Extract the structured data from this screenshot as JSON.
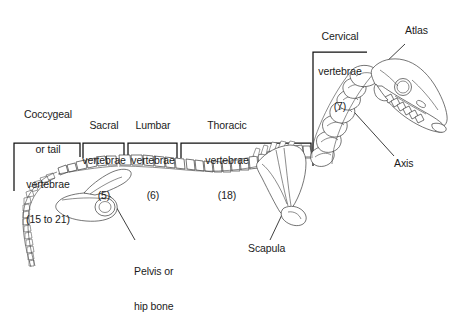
{
  "figure": {
    "background_color": "#ffffff",
    "line_color": "#3a3a3a",
    "text_color": "#1b1b1b"
  },
  "region_labels": [
    {
      "id": "coccygeal",
      "lines": [
        "Coccygeal",
        "or tail",
        "vertebrae",
        "(15 to 21)"
      ],
      "count_text": "(15 to 21)",
      "name": "Coccygeal or tail vertebrae",
      "bracket": {
        "left": 14,
        "right": 80,
        "top": 143
      }
    },
    {
      "id": "sacral",
      "lines": [
        "Sacral",
        "vertebrae",
        "(5)"
      ],
      "count_text": "(5)",
      "name": "Sacral vertebrae",
      "bracket": {
        "left": 83,
        "right": 124,
        "top": 143
      }
    },
    {
      "id": "lumbar",
      "lines": [
        "Lumbar",
        "vertebrae",
        "(6)"
      ],
      "count_text": "(6)",
      "name": "Lumbar vertebrae",
      "bracket": {
        "left": 128,
        "right": 177,
        "top": 143
      }
    },
    {
      "id": "thoracic",
      "lines": [
        "Thoracic",
        "vertebrae",
        "(18)"
      ],
      "count_text": "(18)",
      "name": "Thoracic vertebrae",
      "bracket": {
        "left": 181,
        "right": 311,
        "top": 143
      }
    },
    {
      "id": "cervical",
      "lines": [
        "Cervical",
        "vertebrae",
        "(7)"
      ],
      "count_text": "(7)",
      "name": "Cervical vertebrae",
      "bracket": {
        "left": 311,
        "right": 367,
        "top": 48
      }
    }
  ],
  "callout_labels": [
    {
      "id": "atlas",
      "text": "Atlas",
      "name": "Atlas vertebra"
    },
    {
      "id": "axis",
      "text": "Axis",
      "name": "Axis vertebra"
    },
    {
      "id": "pelvis",
      "lines": [
        "Pelvis or",
        "hip bone"
      ],
      "name": "Pelvis or hip bone"
    },
    {
      "id": "scapula",
      "text": "Scapula",
      "name": "Scapula"
    }
  ]
}
